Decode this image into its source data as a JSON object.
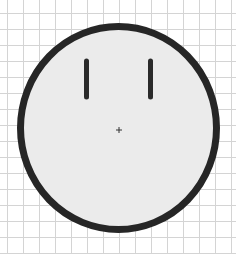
{
  "diagram": {
    "background_color": "#ffffff",
    "grid": {
      "color": "#d4d4d4",
      "spacing": 16,
      "offset_x": 7,
      "offset_y": 13,
      "line_width": 1
    },
    "face": {
      "cx": 118.5,
      "cy": 128,
      "rx": 98,
      "ry": 101.5,
      "fill": "#ebebeb",
      "stroke": "#262626",
      "stroke_width": 7
    },
    "eyes": [
      {
        "name": "left-eye",
        "x": 86.5,
        "y1": 61,
        "y2": 97,
        "width": 5,
        "color": "#2a2a2a"
      },
      {
        "name": "right-eye",
        "x": 150.5,
        "y1": 61,
        "y2": 97,
        "width": 5,
        "color": "#2a2a2a"
      }
    ],
    "center_mark": {
      "x": 119,
      "y": 130,
      "size": 3,
      "color": "#333333",
      "symbol": "+"
    }
  }
}
